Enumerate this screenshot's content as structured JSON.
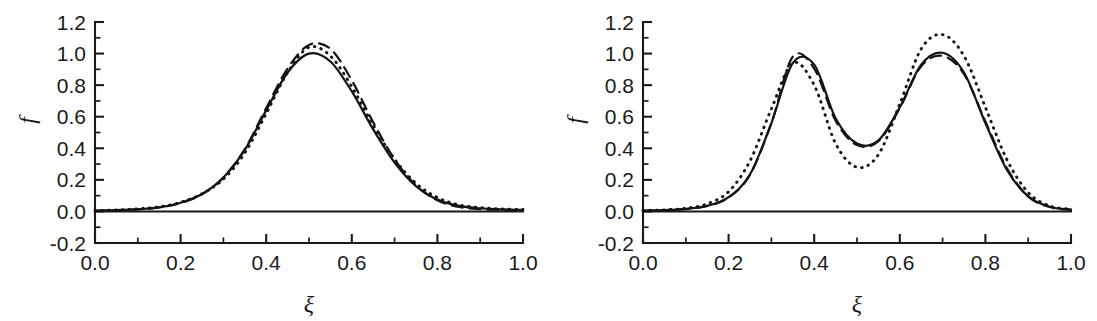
{
  "figure": {
    "background_color": "#ffffff",
    "ink_color": "#141414",
    "panel_count": 2
  },
  "axes": {
    "y_label": "f",
    "x_label": "ξ",
    "y_ticks": [
      "-0.2",
      "0.0",
      "0.2",
      "0.4",
      "0.6",
      "0.8",
      "1.0",
      "1.2"
    ],
    "y_tick_values": [
      -0.2,
      0.0,
      0.2,
      0.4,
      0.6,
      0.8,
      1.0,
      1.2
    ],
    "x_ticks": [
      "0.0",
      "0.2",
      "0.4",
      "0.6",
      "0.8",
      "1.0"
    ],
    "x_tick_values": [
      0.0,
      0.2,
      0.4,
      0.6,
      0.8,
      1.0
    ],
    "minor_ticks_per_interval": 1
  },
  "chart_data": [
    {
      "type": "line",
      "title": "",
      "panel": "left",
      "xlabel": "ξ",
      "ylabel": "f",
      "xlim": [
        0.0,
        1.0
      ],
      "ylim": [
        -0.2,
        1.2
      ],
      "grid": false,
      "legend": "none",
      "x": [
        0.0,
        0.05,
        0.1,
        0.15,
        0.2,
        0.25,
        0.3,
        0.35,
        0.4,
        0.45,
        0.5,
        0.55,
        0.6,
        0.65,
        0.7,
        0.75,
        0.8,
        0.85,
        0.9,
        0.95,
        1.0
      ],
      "series": [
        {
          "name": "solid",
          "style": "solid",
          "values": [
            0.005,
            0.008,
            0.014,
            0.026,
            0.055,
            0.11,
            0.215,
            0.39,
            0.64,
            0.88,
            1.0,
            0.95,
            0.76,
            0.52,
            0.31,
            0.16,
            0.075,
            0.035,
            0.02,
            0.013,
            0.01
          ]
        },
        {
          "name": "dashed",
          "style": "dashed",
          "values": [
            0.004,
            0.007,
            0.013,
            0.025,
            0.053,
            0.108,
            0.215,
            0.395,
            0.655,
            0.905,
            1.055,
            1.03,
            0.83,
            0.565,
            0.33,
            0.165,
            0.07,
            0.028,
            0.014,
            0.01,
            0.008
          ]
        },
        {
          "name": "dotted",
          "style": "dotted",
          "values": [
            0.006,
            0.009,
            0.016,
            0.029,
            0.058,
            0.112,
            0.205,
            0.37,
            0.62,
            0.88,
            1.04,
            0.985,
            0.79,
            0.545,
            0.33,
            0.178,
            0.088,
            0.042,
            0.024,
            0.016,
            0.012
          ]
        }
      ]
    },
    {
      "type": "line",
      "title": "",
      "panel": "right",
      "xlabel": "ξ",
      "ylabel": "f",
      "xlim": [
        0.0,
        1.0
      ],
      "ylim": [
        -0.2,
        1.2
      ],
      "grid": false,
      "legend": "none",
      "x": [
        0.0,
        0.05,
        0.1,
        0.15,
        0.2,
        0.25,
        0.3,
        0.35,
        0.4,
        0.45,
        0.5,
        0.55,
        0.6,
        0.65,
        0.7,
        0.75,
        0.8,
        0.85,
        0.9,
        0.95,
        1.0
      ],
      "series": [
        {
          "name": "solid",
          "style": "solid",
          "values": [
            0.005,
            0.008,
            0.016,
            0.035,
            0.09,
            0.235,
            0.56,
            0.94,
            0.93,
            0.59,
            0.43,
            0.45,
            0.66,
            0.93,
            1.005,
            0.88,
            0.56,
            0.265,
            0.095,
            0.03,
            0.012
          ]
        },
        {
          "name": "dashed",
          "style": "dashed",
          "values": [
            0.004,
            0.008,
            0.015,
            0.034,
            0.088,
            0.232,
            0.56,
            0.98,
            0.905,
            0.575,
            0.42,
            0.445,
            0.655,
            0.92,
            0.985,
            0.87,
            0.57,
            0.275,
            0.095,
            0.028,
            0.01
          ]
        },
        {
          "name": "dotted",
          "style": "dotted",
          "values": [
            0.006,
            0.01,
            0.02,
            0.048,
            0.125,
            0.32,
            0.65,
            0.94,
            0.8,
            0.43,
            0.28,
            0.36,
            0.68,
            1.03,
            1.12,
            0.985,
            0.66,
            0.33,
            0.12,
            0.035,
            0.014
          ]
        }
      ]
    }
  ]
}
